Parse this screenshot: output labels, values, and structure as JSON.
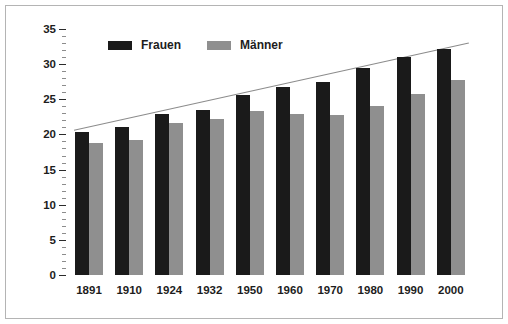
{
  "chart_data": {
    "type": "bar",
    "title": "",
    "subtitle": "",
    "xlabel": "",
    "ylabel": "Fernere Lebenserwartung in Jahren",
    "categories": [
      "1891",
      "1910",
      "1924",
      "1932",
      "1950",
      "1960",
      "1970",
      "1980",
      "1990",
      "2000"
    ],
    "series": [
      {
        "name": "Frauen",
        "color": "#1a1a1a",
        "values": [
          20.4,
          21.1,
          22.9,
          23.5,
          25.6,
          26.8,
          27.5,
          29.4,
          31.0,
          32.2
        ]
      },
      {
        "name": "Männer",
        "color": "#8f8f8f",
        "values": [
          18.8,
          19.2,
          21.6,
          22.2,
          23.4,
          22.9,
          22.8,
          24.0,
          25.8,
          27.8
        ]
      }
    ],
    "annotations": [
      {
        "type": "trend-line",
        "name": "trend-line",
        "color": "#8c8c8c",
        "x_start": "1891",
        "y_start": 20.6,
        "x_end": "2000",
        "y_end": 33.0
      }
    ],
    "ylim": [
      0,
      35
    ],
    "y_ticks": [
      0,
      5,
      10,
      15,
      20,
      25,
      30,
      35
    ],
    "y_tick_labels": [
      "0",
      "5",
      "10",
      "15",
      "20",
      "25",
      "30",
      "35"
    ],
    "y_minor_tick_step": 1,
    "grid": false,
    "legend": {
      "position": "top-left-inside",
      "entries": [
        {
          "label": "Frauen",
          "color": "#1a1a1a"
        },
        {
          "label": "Männer",
          "color": "#8f8f8f"
        }
      ]
    }
  },
  "figure": {
    "border_color": "#b4b4b4",
    "background": "#ffffff"
  }
}
